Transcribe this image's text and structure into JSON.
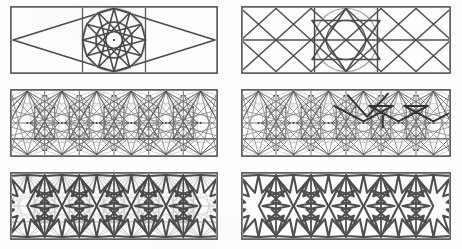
{
  "figure": {
    "kind": "geometric-construction-plate",
    "title": "",
    "width": 462,
    "height": 249,
    "background_color": "#fefefe",
    "columns": 2,
    "rows": 3,
    "panel_count": 6
  },
  "style": {
    "frame_color": "#3a3a3a",
    "construction_color": "#b9b9b9",
    "pattern_color": "#4a4a4a",
    "circle_color": "#8e8e8e",
    "center_dot_color": "#2a2a2a",
    "frame_width": 1.4,
    "pattern_width": 2.0,
    "construction_width": 0.7
  },
  "panels": [
    {
      "id": "panel-1",
      "label": "step-1-rhombus-and-circle",
      "row": 1,
      "col": 1,
      "x": 10,
      "y": 6,
      "w": 208,
      "h": 68,
      "features": [
        "outer-frame",
        "central-circle",
        "twelve-pointed-star",
        "large-rhombus",
        "center-dot"
      ],
      "star_points": 12,
      "cell_count": 1,
      "has_center_dot": true
    },
    {
      "id": "panel-2",
      "label": "step-2-diagonal-lattice",
      "row": 1,
      "col": 2,
      "x": 241,
      "y": 6,
      "w": 210,
      "h": 68,
      "features": [
        "outer-frame",
        "diagonal-lattice",
        "central-circle",
        "inscribed-hexagram",
        "vertical-dividers"
      ],
      "star_points": 6,
      "cell_count": 6,
      "has_center_dot": false
    },
    {
      "id": "panel-3",
      "label": "step-3-construction-web-left",
      "row": 2,
      "col": 1,
      "x": 10,
      "y": 89,
      "w": 208,
      "h": 68,
      "features": [
        "outer-frame",
        "grid-cells",
        "construction-arcs",
        "radiating-lines",
        "node-dots"
      ],
      "star_points": 12,
      "cell_count": 6,
      "has_center_dot": false
    },
    {
      "id": "panel-4",
      "label": "step-4-construction-web-right",
      "row": 2,
      "col": 2,
      "x": 241,
      "y": 89,
      "w": 210,
      "h": 68,
      "features": [
        "outer-frame",
        "grid-cells",
        "construction-arcs",
        "emphasised-polygon-path",
        "node-dots"
      ],
      "star_points": 12,
      "cell_count": 6,
      "has_center_dot": false
    },
    {
      "id": "panel-5",
      "label": "step-5-pattern-over-construction",
      "row": 3,
      "col": 1,
      "x": 10,
      "y": 172,
      "w": 208,
      "h": 68,
      "features": [
        "outer-frame",
        "grid-cells",
        "faint-construction-lines",
        "bold-star-pattern"
      ],
      "star_points": 12,
      "cell_count": 6,
      "has_center_dot": false
    },
    {
      "id": "panel-6",
      "label": "step-6-finished-pattern",
      "row": 3,
      "col": 2,
      "x": 241,
      "y": 172,
      "w": 210,
      "h": 68,
      "features": [
        "outer-frame",
        "grid-dividers",
        "bold-star-pattern",
        "center-dot"
      ],
      "star_points": 12,
      "cell_count": 6,
      "has_center_dot": true
    }
  ]
}
